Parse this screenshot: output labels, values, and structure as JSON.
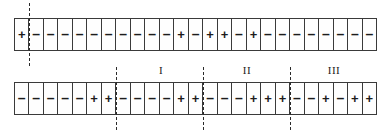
{
  "figure": {
    "name": "sign-sequence-diagram",
    "background_color": "#ffffff",
    "ink_color": "#1a1a1a",
    "plus_glyph": "+",
    "minus_glyph": "–"
  },
  "rows": [
    {
      "id": "row-1",
      "cell_count": 25,
      "signs": [
        "+",
        "-",
        "-",
        "-",
        "-",
        "-",
        "-",
        "-",
        "-",
        "-",
        "-",
        "+",
        "-",
        "+",
        "+",
        "-",
        "+",
        "-",
        "-",
        "-",
        "-",
        "-",
        "-",
        "-",
        "-"
      ],
      "cut_positions": [
        1
      ]
    },
    {
      "id": "row-2",
      "cell_count": 25,
      "signs": [
        "-",
        "-",
        "-",
        "-",
        "-",
        "+",
        "+",
        "-",
        "-",
        "-",
        "-",
        "+",
        "+",
        "-",
        "-",
        "-",
        "+",
        "+",
        "+",
        "-",
        "-",
        "+",
        "-",
        "+",
        "+"
      ],
      "cut_positions": [
        7,
        13,
        19
      ]
    }
  ],
  "block_labels": [
    {
      "text": "I",
      "center_x": 161
    },
    {
      "text": "II",
      "center_x": 247
    },
    {
      "text": "III",
      "center_x": 334
    }
  ]
}
